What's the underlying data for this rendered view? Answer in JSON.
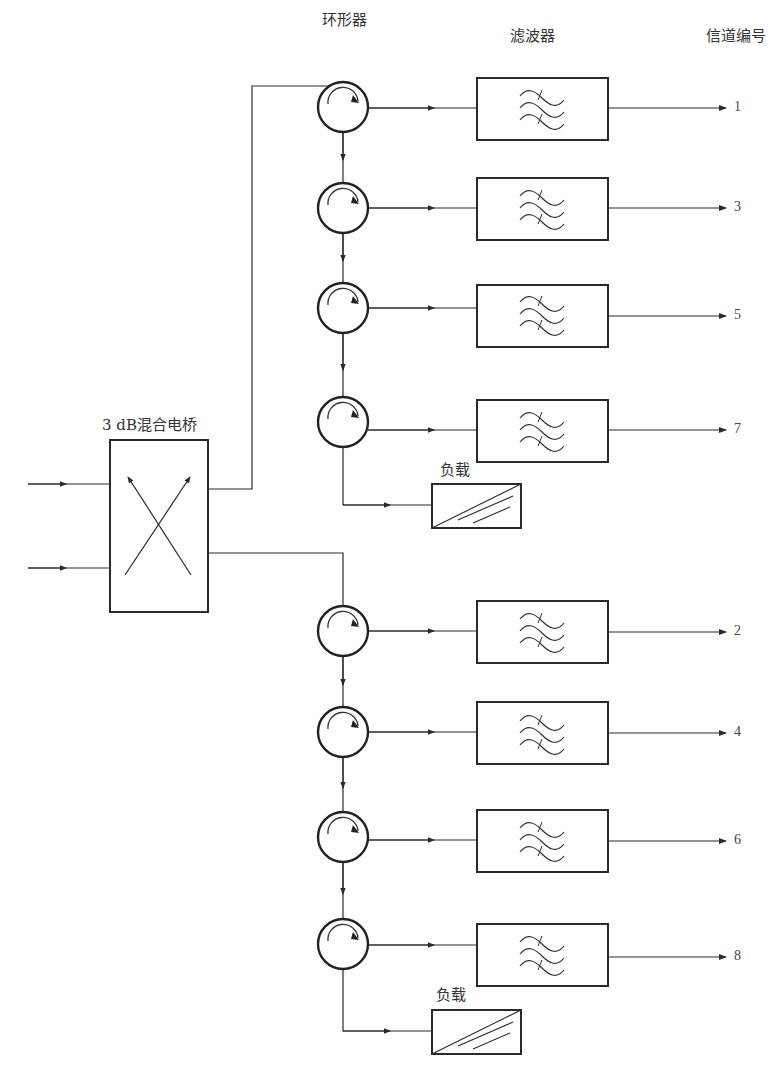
{
  "diagram": {
    "type": "block-diagram",
    "labels": {
      "circulator": "环形器",
      "filter": "滤波器",
      "channel_number": "信道编号",
      "hybrid": "3 dB混合电桥",
      "load_upper": "负载",
      "load_lower": "负载"
    },
    "inputs": 2,
    "upper_branch": {
      "channels": [
        "1",
        "3",
        "5",
        "7"
      ],
      "terminated_with": "负载"
    },
    "lower_branch": {
      "channels": [
        "2",
        "4",
        "6",
        "8"
      ],
      "terminated_with": "负载"
    },
    "icons": {
      "circulator": "circulator-icon",
      "filter": "bandpass-filter-icon",
      "load": "matched-load-icon",
      "hybrid": "hybrid-coupler-icon"
    },
    "colors": {
      "line": "#2a2a2a",
      "background": "#ffffff"
    }
  }
}
